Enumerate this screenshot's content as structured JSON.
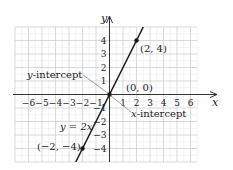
{
  "chart_data": {
    "type": "line",
    "title": "",
    "xlabel": "x",
    "ylabel": "y",
    "xlim": [
      -7,
      6.5
    ],
    "ylim": [
      -5,
      5
    ],
    "grid": true,
    "x_ticks": [
      -6,
      -5,
      -4,
      -3,
      -2,
      -1,
      1,
      2,
      3,
      4,
      5,
      6
    ],
    "y_ticks": [
      -4,
      -3,
      -2,
      -1,
      1,
      2,
      3,
      4
    ],
    "x_tick_labels": [
      "−6",
      "−5",
      "−4",
      "−3",
      "−2",
      "−1",
      "1",
      "2",
      "3",
      "4",
      "5",
      "6"
    ],
    "y_tick_labels": [
      "−4",
      "−3",
      "−2",
      "−1",
      "1",
      "2",
      "3",
      "4"
    ],
    "series": [
      {
        "name": "y = 2x",
        "equation": "y = 2x",
        "x": [
          -2.5,
          2.5
        ],
        "y": [
          -5,
          5
        ]
      }
    ],
    "points": [
      {
        "label": "(2, 4)",
        "x": 2,
        "y": 4
      },
      {
        "label": "(0, 0)",
        "x": 0,
        "y": 0
      },
      {
        "label": "(−2, −4)",
        "x": -2,
        "y": -4
      }
    ],
    "annotations": [
      {
        "text": "y-intercept",
        "points_to": [
          0,
          0
        ]
      },
      {
        "text": "x-intercept",
        "points_to": [
          0,
          0
        ]
      },
      {
        "text": "y = 2x",
        "at": [
          -2.6,
          -2
        ]
      }
    ]
  },
  "labels": {
    "x_axis": "x",
    "y_axis": "y",
    "equation": "y = 2x",
    "y_intercept": "y-intercept",
    "x_intercept": "x-intercept",
    "p1": "(2, 4)",
    "p0": "(0, 0)",
    "p2": "(−2, −4)"
  }
}
